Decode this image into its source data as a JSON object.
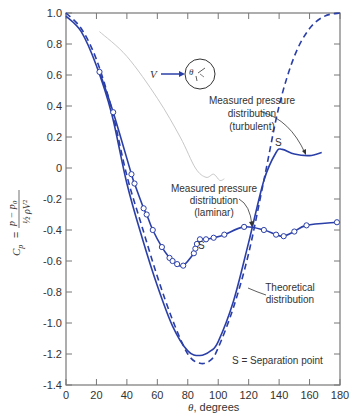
{
  "chart_data": {
    "type": "line",
    "title": "",
    "xlabel": "θ, degrees",
    "ylabel": "C_p = (p − p_0) / (½ ρ V²)",
    "xlim": [
      0,
      180
    ],
    "ylim": [
      -1.4,
      1.0
    ],
    "x_ticks": [
      0,
      20,
      40,
      60,
      80,
      100,
      120,
      140,
      160,
      180
    ],
    "y_ticks": [
      1.0,
      0.8,
      0.6,
      0.4,
      0.2,
      0,
      -0.2,
      -0.4,
      -0.6,
      -0.8,
      -1.0,
      -1.2,
      -1.4
    ],
    "y_tick_labels": [
      "1.0",
      "0.8",
      "0.6",
      "0.4",
      "0.2",
      "0",
      "-0.2",
      "-0.4",
      "-0.6",
      "-0.8",
      "-1.0",
      "-1.2",
      "-1.4"
    ],
    "grid": false,
    "series": [
      {
        "name": "Theoretical distribution",
        "style": "dashed",
        "color": "#2b3fa8",
        "x": [
          0,
          10,
          20,
          30,
          40,
          50,
          60,
          70,
          80,
          88,
          95,
          100,
          110,
          120,
          130,
          140,
          150,
          160,
          170,
          180
        ],
        "y": [
          1.0,
          0.9,
          0.7,
          0.38,
          -0.05,
          -0.38,
          -0.7,
          -0.98,
          -1.2,
          -1.26,
          -1.24,
          -1.16,
          -0.9,
          -0.55,
          -0.08,
          0.4,
          0.72,
          0.9,
          0.98,
          1.0
        ]
      },
      {
        "name": "Measured pressure distribution (turbulent)",
        "style": "solid",
        "color": "#2b3fa8",
        "x": [
          0,
          10,
          20,
          30,
          40,
          50,
          60,
          70,
          80,
          88,
          95,
          100,
          110,
          120,
          130,
          138,
          142,
          150,
          160,
          168
        ],
        "y": [
          0.98,
          0.88,
          0.66,
          0.35,
          -0.1,
          -0.45,
          -0.76,
          -1.02,
          -1.18,
          -1.21,
          -1.18,
          -1.12,
          -0.86,
          -0.48,
          -0.08,
          0.1,
          0.12,
          0.09,
          0.08,
          0.1
        ]
      },
      {
        "name": "Measured pressure distribution (laminar)",
        "style": "solid-with-markers",
        "color": "#2b3fa8",
        "x": [
          22,
          31,
          43,
          45,
          51,
          53,
          57,
          63,
          68,
          70,
          73,
          77,
          84,
          85,
          86,
          88,
          92,
          97,
          104,
          117,
          130,
          138,
          143,
          150,
          158,
          178
        ],
        "y": [
          0.62,
          0.36,
          -0.04,
          -0.1,
          -0.26,
          -0.3,
          -0.4,
          -0.51,
          -0.58,
          -0.6,
          -0.62,
          -0.63,
          -0.55,
          -0.52,
          -0.49,
          -0.46,
          -0.46,
          -0.45,
          -0.43,
          -0.38,
          -0.4,
          -0.43,
          -0.44,
          -0.41,
          -0.37,
          -0.35
        ]
      },
      {
        "name": "background-ghost-curve",
        "style": "solid-light",
        "color": "#c8c8c8",
        "x": [
          22,
          40,
          60,
          75,
          85,
          92,
          97,
          101,
          104
        ],
        "y": [
          0.88,
          0.72,
          0.45,
          0.2,
          0.0,
          -0.06,
          -0.04,
          -0.08,
          -0.07
        ]
      }
    ],
    "annotations": [
      {
        "text": "Measured pressure distribution (turbulent)",
        "lines": [
          "Measured pressure",
          "distribution",
          "(turbulent)"
        ],
        "arrow_to": [
          145,
          0.08
        ]
      },
      {
        "text": "Measured pressure distribution (laminar)",
        "lines": [
          "Measured pressure",
          "distribution",
          "(laminar)"
        ],
        "arrow_to": [
          127,
          -0.4
        ]
      },
      {
        "text": "Theoretical distribution",
        "lines": [
          "Theoretical",
          "distribution"
        ],
        "arrow_to": [
          121,
          -0.55
        ]
      },
      {
        "text": "S",
        "at": [
          137,
          0.17
        ],
        "meaning": "separation point (turbulent)"
      },
      {
        "text": "S",
        "at": [
          92,
          -0.52
        ],
        "meaning": "separation point (laminar)"
      },
      {
        "text": "S = Separation point"
      },
      {
        "text": "V",
        "meaning": "free-stream velocity arrow into cylinder inset"
      },
      {
        "text": "θ",
        "meaning": "angle on cylinder inset"
      }
    ]
  },
  "labels": {
    "xlabel_theta": "θ",
    "xlabel_rest": ", degrees",
    "ylabel_cp": "C",
    "ylabel_sub": "p",
    "ylabel_eq": "=",
    "ylabel_num": "p − p",
    "ylabel_num_sub": "0",
    "ylabel_den": "½ ρV²",
    "turbulent": [
      "Measured pressure",
      "distribution",
      "(turbulent)"
    ],
    "laminar": [
      "Measured pressure",
      "distribution",
      "(laminar)"
    ],
    "theoretical": [
      "Theoretical",
      "distribution"
    ],
    "sep_turb": "S",
    "sep_lam": "S",
    "legend_sep": "S = Separation point",
    "v_label": "V",
    "theta_inset": "θ"
  }
}
